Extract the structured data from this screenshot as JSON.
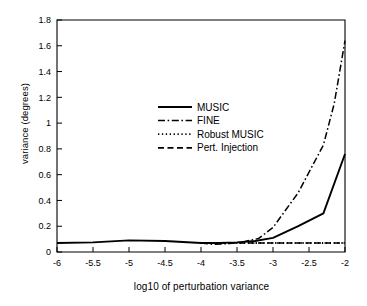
{
  "chart_data": {
    "type": "line",
    "title": "",
    "xlabel": "log10 of perturbation variance",
    "ylabel": "variance (degrees)",
    "xlim": [
      -6,
      -2
    ],
    "ylim": [
      0,
      1.8
    ],
    "grid": false,
    "legend_position": "center-left-upper-middle",
    "xticks": [
      "-6",
      "-5.5",
      "-5",
      "-4.5",
      "-4",
      "-3.5",
      "-3",
      "-2.5",
      "-2"
    ],
    "xtick_values": [
      -6,
      -5.5,
      -5,
      -4.5,
      -4,
      -3.5,
      -3,
      -2.5,
      -2
    ],
    "yticks": [
      "0",
      "0.2",
      "0.4",
      "0.6",
      "0.8",
      "1",
      "1.2",
      "1.4",
      "1.6",
      "1.8"
    ],
    "ytick_values": [
      0,
      0.2,
      0.4,
      0.6,
      0.8,
      1.0,
      1.2,
      1.4,
      1.6,
      1.8
    ],
    "series": [
      {
        "name": "MUSIC",
        "style": "solid",
        "color": "#000000",
        "x": [
          -6,
          -5.5,
          -5,
          -4.5,
          -4,
          -3.75,
          -3.5,
          -3.25,
          -3,
          -2.65,
          -2.3,
          -2
        ],
        "values": [
          0.07,
          0.075,
          0.09,
          0.085,
          0.07,
          0.07,
          0.075,
          0.085,
          0.11,
          0.2,
          0.3,
          0.76
        ]
      },
      {
        "name": "FINE",
        "style": "dash-dot",
        "color": "#000000",
        "x": [
          -4,
          -3.85,
          -3.6,
          -3.4,
          -3.2,
          -3,
          -2.65,
          -2.3,
          -2.15,
          -2
        ],
        "values": [
          0.07,
          0.06,
          0.065,
          0.08,
          0.105,
          0.19,
          0.46,
          0.83,
          1.15,
          1.64
        ]
      },
      {
        "name": "Robust MUSIC",
        "style": "dotted",
        "color": "#000000",
        "x": [
          -4,
          -3.7,
          -3.4,
          -3.1,
          -2.8,
          -2.5,
          -2.2,
          -2
        ],
        "values": [
          0.07,
          0.07,
          0.07,
          0.07,
          0.07,
          0.07,
          0.07,
          0.07
        ]
      },
      {
        "name": "Pert. Injection",
        "style": "dashed",
        "color": "#000000",
        "x": [
          -4,
          -3.5,
          -3,
          -2.5,
          -2
        ],
        "values": [
          0.07,
          0.07,
          0.07,
          0.07,
          0.07
        ]
      }
    ]
  },
  "legend": {
    "items": [
      {
        "label": "MUSIC",
        "style": "solid"
      },
      {
        "label": "FINE",
        "style": "dash-dot"
      },
      {
        "label": "Robust MUSIC",
        "style": "dotted"
      },
      {
        "label": "Pert. Injection",
        "style": "dashed"
      }
    ]
  }
}
